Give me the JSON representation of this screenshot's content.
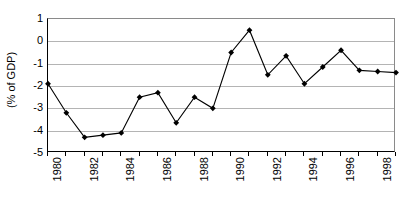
{
  "chart_data": {
    "type": "line",
    "title": "",
    "subtitle": "",
    "xlabel": "",
    "ylabel": "(% of GDP)",
    "x": [
      1980,
      1981,
      1982,
      1983,
      1984,
      1985,
      1986,
      1987,
      1988,
      1989,
      1990,
      1991,
      1992,
      1993,
      1994,
      1995,
      1996,
      1997,
      1998,
      1999
    ],
    "values": [
      -1.9,
      -3.2,
      -4.3,
      -4.2,
      -4.1,
      -2.5,
      -2.3,
      -3.65,
      -2.5,
      -3.0,
      -0.5,
      0.5,
      -1.5,
      -0.65,
      -1.9,
      -1.15,
      -0.4,
      -1.3,
      -1.35,
      -1.4
    ],
    "series": [
      {
        "name": "Balance (% of GDP)",
        "values": [
          -1.9,
          -3.2,
          -4.3,
          -4.2,
          -4.1,
          -2.5,
          -2.3,
          -3.65,
          -2.5,
          -3.0,
          -0.5,
          0.5,
          -1.5,
          -0.65,
          -1.9,
          -1.15,
          -0.4,
          -1.3,
          -1.35,
          -1.4
        ]
      }
    ],
    "ylim": [
      -5,
      1
    ],
    "xlim": [
      1980,
      1999
    ],
    "yticks": [
      1,
      0,
      -1,
      -2,
      -3,
      -4,
      -5
    ],
    "ytick_labels": [
      "1",
      "0",
      "-1",
      "-2",
      "-3",
      "-4",
      "-5"
    ],
    "xticks": [
      1980,
      1982,
      1984,
      1986,
      1988,
      1990,
      1992,
      1994,
      1996,
      1998
    ],
    "xtick_labels": [
      "1980",
      "1982",
      "1984",
      "1986",
      "1988",
      "1990",
      "1992",
      "1994",
      "1996",
      "1998"
    ],
    "grid": true,
    "grid_axis": "y",
    "legend": false,
    "legend_position": "none",
    "marker": "diamond",
    "line_color": "#000000",
    "marker_color": "#000000",
    "grid_color": "#b4b4b4",
    "axis_color": "#000000",
    "background_color": "#ffffff"
  }
}
